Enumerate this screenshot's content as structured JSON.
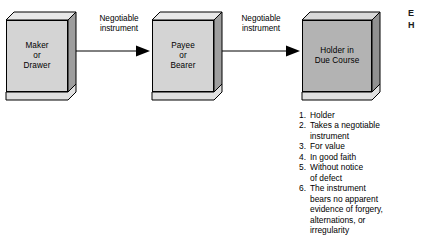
{
  "diagram": {
    "colors": {
      "box_light_fill": "#d4d4d4",
      "box_dark_fill": "#b3b3b3",
      "box_top_fill": "#e8e8e8",
      "box_side_fill": "#9e9e9e",
      "box_shadow_fill": "#e0e0e0",
      "outline": "#000000",
      "text": "#000000",
      "background": "#ffffff"
    },
    "nodes": [
      {
        "id": "maker",
        "lines": [
          "Maker",
          "or",
          "Drawer"
        ],
        "shade": "light"
      },
      {
        "id": "payee",
        "lines": [
          "Payee",
          "or",
          "Bearer"
        ],
        "shade": "light"
      },
      {
        "id": "holder",
        "lines": [
          "Holder in",
          "Due Course"
        ],
        "shade": "dark"
      }
    ],
    "arrows": [
      {
        "id": "arrow-1",
        "from": "maker",
        "to": "payee",
        "label_lines": [
          "Negotiable",
          "instrument"
        ]
      },
      {
        "id": "arrow-2",
        "from": "payee",
        "to": "holder",
        "label_lines": [
          "Negotiable",
          "instrument"
        ]
      }
    ]
  },
  "requirements": {
    "items": [
      {
        "num": "1.",
        "lines": [
          "Holder"
        ]
      },
      {
        "num": "2.",
        "lines": [
          "Takes a negotiable",
          "instrument"
        ]
      },
      {
        "num": "3.",
        "lines": [
          "For value"
        ]
      },
      {
        "num": "4.",
        "lines": [
          "In good faith"
        ]
      },
      {
        "num": "5.",
        "lines": [
          "Without notice",
          "of defect"
        ]
      },
      {
        "num": "6.",
        "lines": [
          "The instrument",
          "bears no apparent",
          "evidence of forgery,",
          "alternations, or",
          "irregularity"
        ]
      }
    ]
  },
  "edge_caption": {
    "lines": [
      "E",
      "H"
    ]
  }
}
